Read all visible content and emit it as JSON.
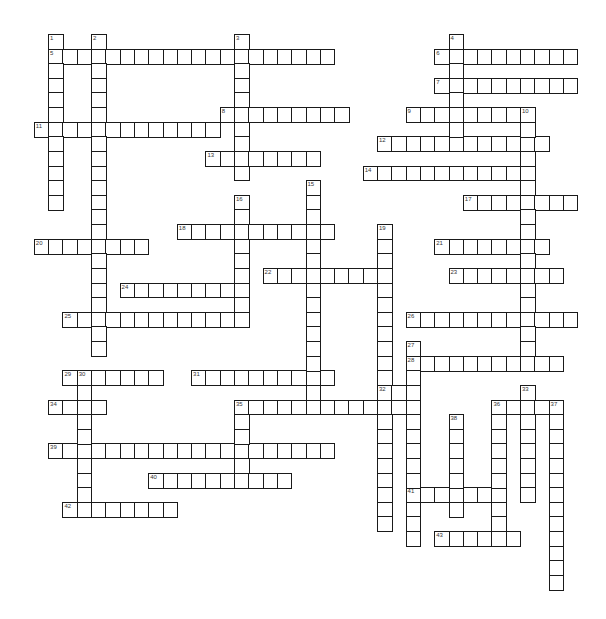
{
  "puzzle": {
    "type": "crossword",
    "grid": {
      "origin_x": 33.8,
      "origin_y": 34,
      "cell_w": 14.3,
      "cell_h": 14.62
    },
    "across": [
      {
        "num": "5",
        "row": 1,
        "col": 1,
        "len": 20
      },
      {
        "num": "6",
        "row": 1,
        "col": 28,
        "len": 10
      },
      {
        "num": "7",
        "row": 3,
        "col": 28,
        "len": 10
      },
      {
        "num": "8",
        "row": 5,
        "col": 13,
        "len": 9
      },
      {
        "num": "9",
        "row": 5,
        "col": 26,
        "len": 9
      },
      {
        "num": "11",
        "row": 6,
        "col": 0,
        "len": 13
      },
      {
        "num": "12",
        "row": 7,
        "col": 24,
        "len": 12
      },
      {
        "num": "13",
        "row": 8,
        "col": 12,
        "len": 8
      },
      {
        "num": "14",
        "row": 9,
        "col": 23,
        "len": 12
      },
      {
        "num": "17",
        "row": 11,
        "col": 30,
        "len": 8
      },
      {
        "num": "18",
        "row": 13,
        "col": 10,
        "len": 11
      },
      {
        "num": "20",
        "row": 14,
        "col": 0,
        "len": 8
      },
      {
        "num": "21",
        "row": 14,
        "col": 28,
        "len": 8
      },
      {
        "num": "22",
        "row": 16,
        "col": 16,
        "len": 9
      },
      {
        "num": "23",
        "row": 16,
        "col": 29,
        "len": 8
      },
      {
        "num": "24",
        "row": 17,
        "col": 6,
        "len": 9
      },
      {
        "num": "25",
        "row": 19,
        "col": 2,
        "len": 13
      },
      {
        "num": "26",
        "row": 19,
        "col": 26,
        "len": 12
      },
      {
        "num": "28",
        "row": 22,
        "col": 26,
        "len": 11
      },
      {
        "num": "29",
        "row": 23,
        "col": 2,
        "len": 7
      },
      {
        "num": "31",
        "row": 23,
        "col": 11,
        "len": 10
      },
      {
        "num": "32",
        "row": 24,
        "col": 24,
        "len": 2
      },
      {
        "num": "34",
        "row": 25,
        "col": 1,
        "len": 4
      },
      {
        "num": "35",
        "row": 25,
        "col": 14,
        "len": 12
      },
      {
        "num": "36",
        "row": 25,
        "col": 32,
        "len": 5
      },
      {
        "num": "39",
        "row": 28,
        "col": 1,
        "len": 20
      },
      {
        "num": "40",
        "row": 30,
        "col": 8,
        "len": 10
      },
      {
        "num": "41",
        "row": 31,
        "col": 26,
        "len": 7
      },
      {
        "num": "42",
        "row": 32,
        "col": 2,
        "len": 8
      },
      {
        "num": "43",
        "row": 34,
        "col": 28,
        "len": 6
      }
    ],
    "down": [
      {
        "num": "1",
        "row": 0,
        "col": 1,
        "len": 12
      },
      {
        "num": "2",
        "row": 0,
        "col": 4,
        "len": 22
      },
      {
        "num": "3",
        "row": 0,
        "col": 14,
        "len": 10
      },
      {
        "num": "4",
        "row": 0,
        "col": 29,
        "len": 8
      },
      {
        "num": "10",
        "row": 5,
        "col": 34,
        "len": 18
      },
      {
        "num": "15",
        "row": 10,
        "col": 19,
        "len": 16
      },
      {
        "num": "16",
        "row": 11,
        "col": 14,
        "len": 9
      },
      {
        "num": "19",
        "row": 13,
        "col": 24,
        "len": 21
      },
      {
        "num": "27",
        "row": 21,
        "col": 26,
        "len": 14
      },
      {
        "num": "30",
        "row": 23,
        "col": 3,
        "len": 10
      },
      {
        "num": "33",
        "row": 24,
        "col": 34,
        "len": 8
      },
      {
        "num": "35",
        "row": 25,
        "col": 14,
        "len": 6
      },
      {
        "num": "36",
        "row": 25,
        "col": 32,
        "len": 10
      },
      {
        "num": "37",
        "row": 25,
        "col": 36,
        "len": 13
      },
      {
        "num": "38",
        "row": 26,
        "col": 29,
        "len": 7
      }
    ]
  }
}
